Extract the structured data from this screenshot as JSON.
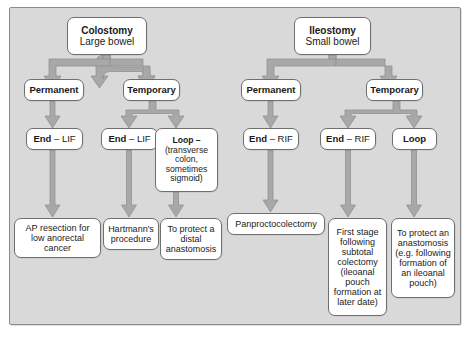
{
  "diagram": {
    "colors": {
      "panel_background": "#d9d9d9",
      "panel_border": "#8c8c8c",
      "node_background": "#ffffff",
      "node_border": "#6f6f6f",
      "arrow_fill": "#a6a6a6",
      "arrow_stroke": "#8f8f8f",
      "text": "#1a1a1a"
    },
    "roots": [
      {
        "id": "colostomy",
        "title": "Colostomy",
        "subtitle": "Large bowel"
      },
      {
        "id": "ileostomy",
        "title": "Ileostomy",
        "subtitle": "Small bowel"
      }
    ],
    "level2": [
      {
        "id": "colo-permanent",
        "label": "Permanent"
      },
      {
        "id": "colo-temporary",
        "label": "Temporary"
      },
      {
        "id": "ileo-permanent",
        "label": "Permanent"
      },
      {
        "id": "ileo-temporary",
        "label": "Temporary"
      }
    ],
    "level3": [
      {
        "id": "colo-perm-end",
        "label": "End",
        "suffix": "– LIF",
        "detail": ""
      },
      {
        "id": "colo-temp-end",
        "label": "End",
        "suffix": "– LIF",
        "detail": ""
      },
      {
        "id": "colo-temp-loop",
        "label": "Loop –",
        "suffix": "",
        "detail": "(transverse colon, sometimes sigmoid)"
      },
      {
        "id": "ileo-perm-end",
        "label": "End",
        "suffix": "– RIF",
        "detail": ""
      },
      {
        "id": "ileo-temp-end",
        "label": "End",
        "suffix": "– RIF",
        "detail": ""
      },
      {
        "id": "ileo-temp-loop",
        "label": "Loop",
        "suffix": "",
        "detail": ""
      }
    ],
    "level4": [
      {
        "id": "outcome-ap-resection",
        "text": "AP resection for low anorectal cancer"
      },
      {
        "id": "outcome-hartmanns",
        "text": "Hartmann's procedure"
      },
      {
        "id": "outcome-protect-distal",
        "text": "To protect a distal anastomosis"
      },
      {
        "id": "outcome-panproctocolectomy",
        "text": "Panproctocolectomy"
      },
      {
        "id": "outcome-first-stage",
        "text": "First stage following subtotal colectomy (ileoanal pouch formation at later date)"
      },
      {
        "id": "outcome-protect-anastomosis",
        "text": "To protect an anastomosis (e.g. following formation of an ileoanal pouch)"
      }
    ]
  }
}
